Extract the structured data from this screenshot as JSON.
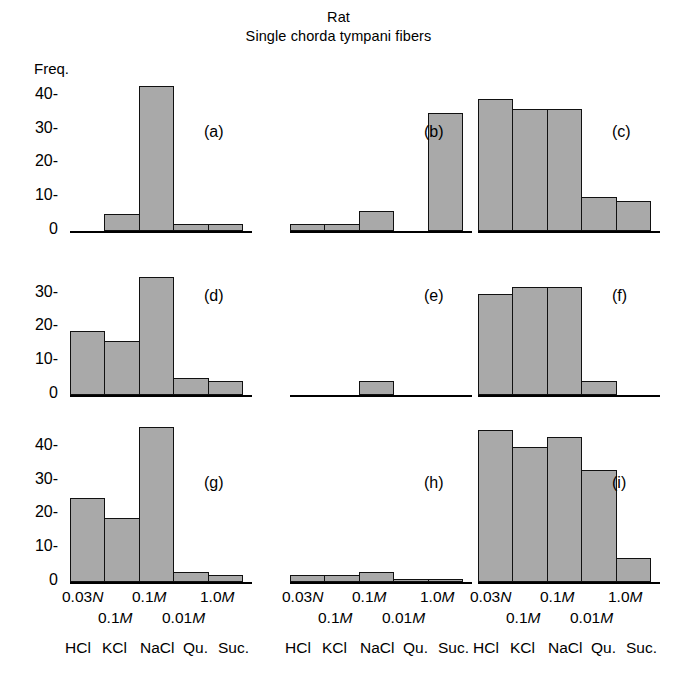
{
  "title": {
    "line1": "Rat",
    "line2": "Single chorda tympani fibers"
  },
  "yaxis": {
    "label": "Freq.",
    "ticks": [
      "40-",
      "30-",
      "20-",
      "10-",
      "0"
    ],
    "tick_values": [
      40,
      30,
      20,
      10,
      0
    ]
  },
  "xaxis": {
    "concentration_row1": [
      "0.03",
      "N",
      "0.1",
      "M",
      "1.0",
      "M"
    ],
    "concentration_row2": [
      "0.1",
      "M",
      "0.01",
      "M"
    ],
    "stimuli": [
      "HCl",
      "KCl",
      "NaCl",
      "Qu.",
      "Suc."
    ],
    "conc_labels": [
      "0.03N",
      "0.1M",
      "0.1M",
      "0.01M",
      "1.0M"
    ]
  },
  "panel_labels": {
    "a": "(a)",
    "b": "(b)",
    "c": "(c)",
    "d": "(d)",
    "e": "(e)",
    "f": "(f)",
    "g": "(g)",
    "h": "(h)",
    "i": "(i)"
  },
  "chart_data": {
    "type": "bar",
    "xlabel": "",
    "ylabel": "Freq.",
    "ylim": [
      0,
      48
    ],
    "grid": false,
    "legend": "none",
    "categories": [
      "HCl",
      "KCl",
      "NaCl",
      "Qu.",
      "Suc."
    ],
    "category_concentrations": [
      "0.03N",
      "0.1M",
      "0.1M",
      "0.01M",
      "1.0M"
    ],
    "panels": [
      {
        "id": "a",
        "label": "(a)",
        "row": 1,
        "col": 1,
        "values": [
          0,
          5,
          43,
          2,
          2
        ]
      },
      {
        "id": "b",
        "label": "(b)",
        "row": 1,
        "col": 2,
        "values": [
          2,
          2,
          6,
          0,
          35
        ]
      },
      {
        "id": "c",
        "label": "(c)",
        "row": 1,
        "col": 3,
        "values": [
          39,
          36,
          36,
          10,
          9
        ]
      },
      {
        "id": "d",
        "label": "(d)",
        "row": 2,
        "col": 1,
        "values": [
          19,
          16,
          35,
          5,
          4
        ]
      },
      {
        "id": "e",
        "label": "(e)",
        "row": 2,
        "col": 2,
        "values": [
          0,
          0,
          4,
          0,
          0
        ]
      },
      {
        "id": "f",
        "label": "(f)",
        "row": 2,
        "col": 3,
        "values": [
          30,
          32,
          32,
          4,
          0
        ]
      },
      {
        "id": "g",
        "label": "(g)",
        "row": 3,
        "col": 1,
        "values": [
          25,
          19,
          46,
          3,
          2
        ]
      },
      {
        "id": "h",
        "label": "(h)",
        "row": 3,
        "col": 2,
        "values": [
          2,
          2,
          3,
          1,
          1
        ]
      },
      {
        "id": "i",
        "label": "(i)",
        "row": 3,
        "col": 3,
        "values": [
          45,
          40,
          43,
          33,
          7
        ]
      }
    ]
  }
}
